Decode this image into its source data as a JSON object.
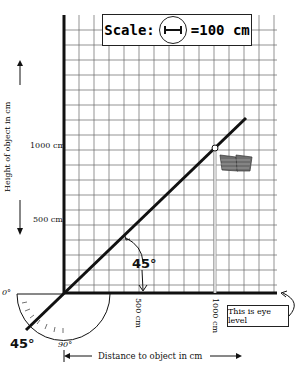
{
  "scale": {
    "label": "Scale:",
    "icon": "circle-with-bar-icon",
    "value": "=100 cm"
  },
  "y_axis": {
    "label": "Height of object in cm",
    "ticks": [
      "1000 cm",
      "500 cm"
    ]
  },
  "x_axis": {
    "label": "Distance to object in cm",
    "ticks": [
      "500 cm",
      "1000 cm"
    ]
  },
  "angles": {
    "upper": "45°",
    "protractor_zero": "0°",
    "protractor_90": "90°",
    "protractor_45": "45°"
  },
  "eye_level": {
    "label": "This is eye level"
  },
  "colors": {
    "line": "#111111",
    "grid": "#555555",
    "flag": "#6e6e6e"
  }
}
